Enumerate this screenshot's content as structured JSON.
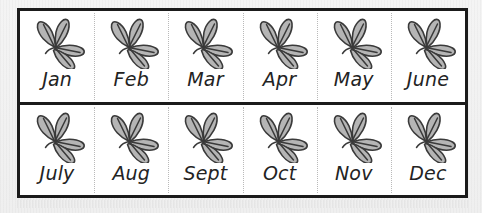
{
  "figure": {
    "type": "month-grid",
    "columns": 6,
    "rows": 2,
    "icon_name": "leaf-sprig-icon",
    "frame_color": "#1b1b1b",
    "cell_background": "#ffffff",
    "page_background": "#f2f2f2",
    "label_color": "#232323",
    "separator_color": "#b9b9b9",
    "leaf_fill": "#b5b5b5",
    "leaf_stroke": "#3a3a3a"
  },
  "rows": [
    {
      "name": "first-half",
      "cells": [
        {
          "label": "Jan"
        },
        {
          "label": "Feb"
        },
        {
          "label": "Mar"
        },
        {
          "label": "Apr"
        },
        {
          "label": "May"
        },
        {
          "label": "June"
        }
      ]
    },
    {
      "name": "second-half",
      "cells": [
        {
          "label": "July"
        },
        {
          "label": "Aug"
        },
        {
          "label": "Sept"
        },
        {
          "label": "Oct"
        },
        {
          "label": "Nov"
        },
        {
          "label": "Dec"
        }
      ]
    }
  ]
}
